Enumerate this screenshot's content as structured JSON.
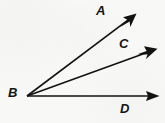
{
  "figure": {
    "kind": "geometry-ray-diagram",
    "background_color": "#f8f8f7",
    "stroke_color": "#121212",
    "canvas": {
      "width": 165,
      "height": 123
    },
    "vertex": {
      "id": "B",
      "label": "B",
      "x": 27,
      "y": 96,
      "label_x": 8,
      "label_y": 86
    },
    "rays": [
      {
        "id": "ray-BA",
        "label": "A",
        "from_x": 27,
        "from_y": 96,
        "to_x": 136,
        "to_y": 14,
        "label_x": 96,
        "label_y": 4
      },
      {
        "id": "ray-BC",
        "label": "C",
        "from_x": 27,
        "from_y": 96,
        "to_x": 157,
        "to_y": 49,
        "label_x": 119,
        "label_y": 37
      },
      {
        "id": "ray-BD",
        "label": "D",
        "from_x": 27,
        "from_y": 96,
        "to_x": 159,
        "to_y": 96,
        "label_x": 120,
        "label_y": 102
      }
    ]
  }
}
